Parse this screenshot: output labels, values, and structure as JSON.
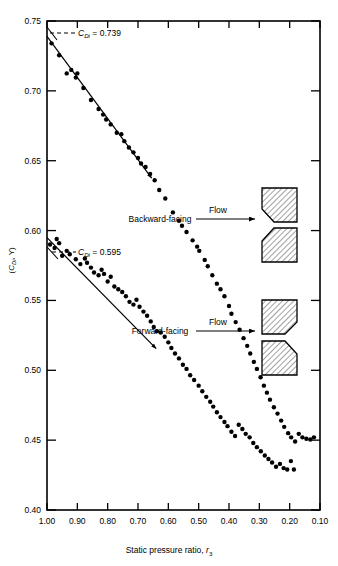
{
  "chart_data": {
    "type": "scatter",
    "title": "",
    "xlabel": "Static pressure ratio, r3",
    "xlabel_main": "Static pressure ratio,",
    "xlabel_sym": "r",
    "xlabel_sub": "3",
    "ylabel": "(CDi, Y)",
    "ylabel_open": "(",
    "ylabel_sym": "C",
    "ylabel_sub": "Di",
    "ylabel_rest": ", Y)",
    "xlim": [
      1.0,
      0.1
    ],
    "ylim": [
      0.4,
      0.75
    ],
    "x_reversed": true,
    "grid": false,
    "legend_position": "in-plot annotations",
    "xticks": [
      "1.00",
      "0.90",
      "0.80",
      "0.70",
      "0.60",
      "0.50",
      "0.40",
      "0.30",
      "0.20",
      "0.10"
    ],
    "xtick_values": [
      1.0,
      0.9,
      0.8,
      0.7,
      0.6,
      0.5,
      0.4,
      0.3,
      0.2,
      0.1
    ],
    "yticks": [
      "0.40",
      "0.45",
      "0.50",
      "0.55",
      "0.60",
      "0.65",
      "0.70",
      "0.75"
    ],
    "ytick_values": [
      0.4,
      0.45,
      0.5,
      0.55,
      0.6,
      0.65,
      0.7,
      0.75
    ],
    "annotations": [
      {
        "name": "backward-intercept",
        "sym": "C",
        "sub": "Di",
        "text": " = 0.739",
        "value": 0.739,
        "x": 1.0
      },
      {
        "name": "forward-intercept",
        "sym": "C",
        "sub": "Di",
        "text": " = 0.595",
        "value": 0.595,
        "x": 1.0
      }
    ],
    "curve_labels": [
      {
        "name": "backward-facing",
        "text": "Backward-facing"
      },
      {
        "name": "forward-facing",
        "text": "Forward-facing"
      }
    ],
    "flow_labels": [
      {
        "name": "flow-upper",
        "text": "Flow"
      },
      {
        "name": "flow-lower",
        "text": "Flow"
      }
    ],
    "series": [
      {
        "name": "Backward-facing",
        "fit_line": {
          "x": [
            1.0,
            0.655
          ],
          "y": [
            0.739,
            0.6375
          ]
        },
        "points": [
          [
            0.985,
            0.734
          ],
          [
            0.96,
            0.7255
          ],
          [
            0.935,
            0.7125
          ],
          [
            0.92,
            0.715
          ],
          [
            0.905,
            0.7095
          ],
          [
            0.9,
            0.7125
          ],
          [
            0.88,
            0.702
          ],
          [
            0.855,
            0.6935
          ],
          [
            0.83,
            0.687
          ],
          [
            0.815,
            0.683
          ],
          [
            0.805,
            0.6795
          ],
          [
            0.79,
            0.676
          ],
          [
            0.77,
            0.67
          ],
          [
            0.755,
            0.669
          ],
          [
            0.745,
            0.664
          ],
          [
            0.73,
            0.6595
          ],
          [
            0.715,
            0.656
          ],
          [
            0.7,
            0.652
          ],
          [
            0.69,
            0.648
          ],
          [
            0.675,
            0.6455
          ],
          [
            0.66,
            0.6405
          ],
          [
            0.645,
            0.636
          ],
          [
            0.63,
            0.629
          ],
          [
            0.61,
            0.623
          ],
          [
            0.585,
            0.613
          ],
          [
            0.565,
            0.607
          ],
          [
            0.555,
            0.6035
          ],
          [
            0.54,
            0.599
          ],
          [
            0.52,
            0.593
          ],
          [
            0.505,
            0.5885
          ],
          [
            0.498,
            0.5855
          ],
          [
            0.48,
            0.579
          ],
          [
            0.47,
            0.5745
          ],
          [
            0.455,
            0.568
          ],
          [
            0.44,
            0.562
          ],
          [
            0.428,
            0.558
          ],
          [
            0.415,
            0.553
          ],
          [
            0.4,
            0.546
          ],
          [
            0.392,
            0.5405
          ],
          [
            0.378,
            0.5345
          ],
          [
            0.365,
            0.529
          ],
          [
            0.352,
            0.523
          ],
          [
            0.34,
            0.5175
          ],
          [
            0.33,
            0.512
          ],
          [
            0.318,
            0.506
          ],
          [
            0.308,
            0.501
          ],
          [
            0.296,
            0.495
          ],
          [
            0.285,
            0.489
          ],
          [
            0.275,
            0.484
          ],
          [
            0.265,
            0.479
          ],
          [
            0.252,
            0.4735
          ],
          [
            0.24,
            0.469
          ],
          [
            0.228,
            0.464
          ],
          [
            0.218,
            0.4595
          ],
          [
            0.205,
            0.455
          ],
          [
            0.195,
            0.452
          ],
          [
            0.182,
            0.449
          ],
          [
            0.17,
            0.4545
          ],
          [
            0.158,
            0.452
          ],
          [
            0.145,
            0.451
          ],
          [
            0.132,
            0.4505
          ],
          [
            0.12,
            0.452
          ]
        ]
      },
      {
        "name": "Forward-facing",
        "fit_line": {
          "x": [
            1.0,
            0.64
          ],
          "y": [
            0.595,
            0.5155
          ]
        },
        "points": [
          [
            0.99,
            0.59
          ],
          [
            0.975,
            0.5875
          ],
          [
            0.968,
            0.594
          ],
          [
            0.96,
            0.591
          ],
          [
            0.95,
            0.582
          ],
          [
            0.935,
            0.5855
          ],
          [
            0.925,
            0.583
          ],
          [
            0.905,
            0.5795
          ],
          [
            0.89,
            0.576
          ],
          [
            0.875,
            0.58
          ],
          [
            0.868,
            0.577
          ],
          [
            0.855,
            0.5735
          ],
          [
            0.845,
            0.57
          ],
          [
            0.83,
            0.568
          ],
          [
            0.82,
            0.572
          ],
          [
            0.812,
            0.569
          ],
          [
            0.8,
            0.5635
          ],
          [
            0.79,
            0.567
          ],
          [
            0.778,
            0.56
          ],
          [
            0.765,
            0.558
          ],
          [
            0.752,
            0.556
          ],
          [
            0.74,
            0.553
          ],
          [
            0.728,
            0.549
          ],
          [
            0.715,
            0.547
          ],
          [
            0.705,
            0.5505
          ],
          [
            0.695,
            0.5455
          ],
          [
            0.682,
            0.542
          ],
          [
            0.67,
            0.539
          ],
          [
            0.658,
            0.535
          ],
          [
            0.648,
            0.531
          ],
          [
            0.638,
            0.528
          ],
          [
            0.625,
            0.527
          ],
          [
            0.612,
            0.524
          ],
          [
            0.6,
            0.52
          ],
          [
            0.59,
            0.516
          ],
          [
            0.578,
            0.512
          ],
          [
            0.565,
            0.5085
          ],
          [
            0.552,
            0.504
          ],
          [
            0.54,
            0.501
          ],
          [
            0.528,
            0.4965
          ],
          [
            0.515,
            0.493
          ],
          [
            0.5,
            0.489
          ],
          [
            0.488,
            0.485
          ],
          [
            0.475,
            0.481
          ],
          [
            0.462,
            0.4775
          ],
          [
            0.452,
            0.474
          ],
          [
            0.44,
            0.47
          ],
          [
            0.428,
            0.4665
          ],
          [
            0.415,
            0.463
          ],
          [
            0.405,
            0.46
          ],
          [
            0.392,
            0.456
          ],
          [
            0.38,
            0.453
          ],
          [
            0.368,
            0.461
          ],
          [
            0.356,
            0.458
          ],
          [
            0.345,
            0.4545
          ],
          [
            0.332,
            0.452
          ],
          [
            0.32,
            0.448
          ],
          [
            0.308,
            0.445
          ],
          [
            0.295,
            0.442
          ],
          [
            0.282,
            0.439
          ],
          [
            0.27,
            0.4365
          ],
          [
            0.258,
            0.434
          ],
          [
            0.245,
            0.431
          ],
          [
            0.232,
            0.433
          ],
          [
            0.22,
            0.43
          ],
          [
            0.208,
            0.429
          ],
          [
            0.196,
            0.435
          ],
          [
            0.186,
            0.429
          ]
        ]
      }
    ],
    "geometry_icons": [
      {
        "name": "boattail-backward-upper",
        "group": "backward"
      },
      {
        "name": "boattail-backward-lower",
        "group": "backward"
      },
      {
        "name": "boattail-forward-upper",
        "group": "forward"
      },
      {
        "name": "boattail-forward-lower",
        "group": "forward"
      }
    ]
  }
}
